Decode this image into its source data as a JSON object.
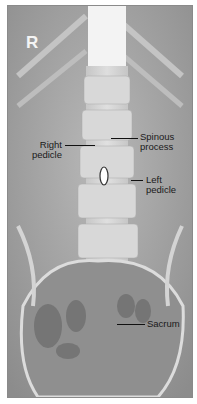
{
  "figure": {
    "orientation_marker": "R",
    "view": "lumbar spine AP radiograph",
    "labels": {
      "right_pedicle": [
        "Right",
        "pedicle"
      ],
      "spinous_process": [
        "Spinous",
        "process"
      ],
      "left_pedicle": [
        "Left",
        "pedicle"
      ],
      "sacrum": "Sacrum"
    },
    "colors": {
      "border": "#8a8a8a",
      "label_text": "#1a1a1a",
      "marker_text": "#f4f4f4"
    }
  }
}
